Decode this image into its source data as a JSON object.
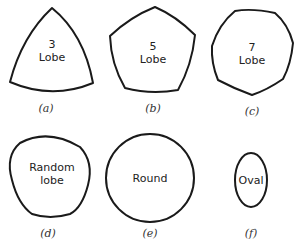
{
  "figure": {
    "panels": [
      {
        "id": "a",
        "caption": "(a)",
        "lines": [
          "3",
          "Lobe"
        ],
        "shape": "3-lobe"
      },
      {
        "id": "b",
        "caption": "(b)",
        "lines": [
          "5",
          "Lobe"
        ],
        "shape": "5-lobe"
      },
      {
        "id": "c",
        "caption": "(c)",
        "lines": [
          "7",
          "Lobe"
        ],
        "shape": "7-lobe"
      },
      {
        "id": "d",
        "caption": "(d)",
        "lines": [
          "Random",
          "lobe"
        ],
        "shape": "random-lobe"
      },
      {
        "id": "e",
        "caption": "(e)",
        "lines": [
          "Round"
        ],
        "shape": "circle"
      },
      {
        "id": "f",
        "caption": "(f)",
        "lines": [
          "Oval"
        ],
        "shape": "oval"
      }
    ],
    "colors": {
      "stroke": "#1a1a1a",
      "background": "#ffffff"
    }
  }
}
